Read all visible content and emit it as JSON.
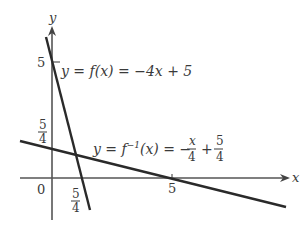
{
  "diagram": {
    "type": "function_and_inverse_graph",
    "axes": {
      "x_label": "x",
      "y_label": "y",
      "origin_label": "0"
    },
    "ticks": {
      "y_five": "5",
      "y_five_fourths_num": "5",
      "y_five_fourths_den": "4",
      "x_five_fourths_num": "5",
      "x_five_fourths_den": "4",
      "x_five": "5"
    },
    "curves": [
      {
        "name": "f",
        "label": "y = f(x) = −4x + 5",
        "slope": -4,
        "intercept": 5
      },
      {
        "name": "f_inverse",
        "label_prefix": "y = f",
        "label_sup": "−1",
        "label_mid": "(x) = −",
        "label_frac1_num": "x",
        "label_frac1_den": "4",
        "label_plus": "+",
        "label_frac2_num": "5",
        "label_frac2_den": "4",
        "slope": -0.25,
        "intercept": 1.25
      }
    ],
    "colors": {
      "axis": "#555555",
      "line": "#2a2a2a",
      "text": "#3a3a3a"
    }
  }
}
